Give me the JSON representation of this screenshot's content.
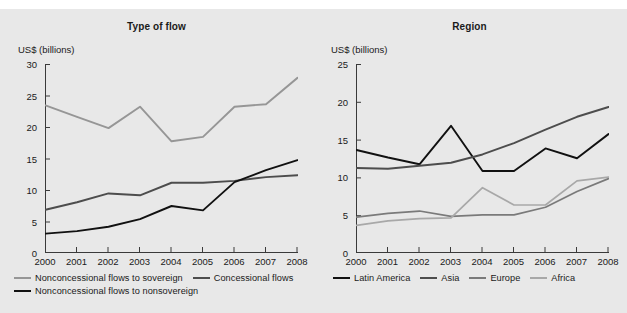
{
  "figure": {
    "background": "#e8e8e8",
    "top_partial_text": ""
  },
  "panels": [
    {
      "id": "type-of-flow",
      "title": "Type of flow",
      "axis_unit": "US$ (billions)"
    },
    {
      "id": "region",
      "title": "Region",
      "axis_unit": "US$ (billions)"
    }
  ],
  "chart_data": [
    {
      "type": "line",
      "title": "Type of flow",
      "xlabel": "",
      "ylabel": "US$ (billions)",
      "categories": [
        "2000",
        "2001",
        "2002",
        "2003",
        "2004",
        "2005",
        "2006",
        "2007",
        "2008"
      ],
      "x": [
        2000,
        2001,
        2002,
        2003,
        2004,
        2005,
        2006,
        2007,
        2008
      ],
      "ylim": [
        0,
        30
      ],
      "yticks": [
        0,
        5,
        10,
        15,
        20,
        25,
        30
      ],
      "grid": false,
      "legend_position": "below",
      "series": [
        {
          "name": "Nonconcessional flows to sovereign",
          "color": "#969696",
          "values": [
            23.4,
            21.6,
            19.8,
            23.2,
            17.7,
            18.4,
            23.2,
            23.6,
            27.8
          ]
        },
        {
          "name": "Concessional flows",
          "color": "#4d4d4d",
          "values": [
            6.8,
            8.0,
            9.4,
            9.1,
            11.1,
            11.1,
            11.4,
            12.0,
            12.3
          ]
        },
        {
          "name": "Nonconcessional flows to nonsovereign",
          "color": "#111111",
          "values": [
            3.0,
            3.4,
            4.1,
            5.3,
            7.4,
            6.7,
            11.2,
            13.1,
            14.7
          ]
        }
      ]
    },
    {
      "type": "line",
      "title": "Region",
      "xlabel": "",
      "ylabel": "US$ (billions)",
      "categories": [
        "2000",
        "2001",
        "2002",
        "2003",
        "2004",
        "2005",
        "2006",
        "2007",
        "2008"
      ],
      "x": [
        2000,
        2001,
        2002,
        2003,
        2004,
        2005,
        2006,
        2007,
        2008
      ],
      "ylim": [
        0,
        25
      ],
      "yticks": [
        0,
        5,
        10,
        15,
        20,
        25
      ],
      "grid": false,
      "legend_position": "below",
      "series": [
        {
          "name": "Latin America",
          "color": "#111111",
          "values": [
            13.6,
            12.6,
            11.7,
            16.8,
            10.8,
            10.8,
            13.8,
            12.5,
            15.7
          ]
        },
        {
          "name": "Asia",
          "color": "#4d4d4d",
          "values": [
            11.2,
            11.1,
            11.5,
            11.9,
            13.0,
            14.5,
            16.3,
            18.0,
            19.3
          ]
        },
        {
          "name": "Europe",
          "color": "#7a7a7a",
          "values": [
            4.7,
            5.2,
            5.5,
            4.8,
            5.0,
            5.0,
            6.0,
            8.1,
            9.8
          ]
        },
        {
          "name": "Africa",
          "color": "#a8a8a8",
          "values": [
            3.6,
            4.2,
            4.5,
            4.6,
            8.6,
            6.3,
            6.3,
            9.5,
            10.0
          ]
        }
      ]
    }
  ]
}
